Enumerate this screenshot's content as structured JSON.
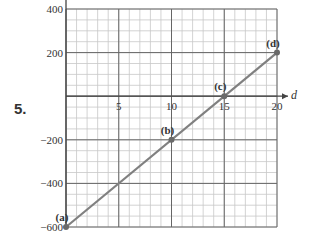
{
  "problem": {
    "number": "5."
  },
  "chart_data": {
    "type": "line",
    "title": "",
    "xlabel": "d",
    "ylabel": "",
    "xlim": [
      0,
      20
    ],
    "ylim": [
      -600,
      400
    ],
    "x_ticks": [
      5,
      10,
      15,
      20
    ],
    "x_tick_labels": [
      "5",
      "10",
      "15",
      "20"
    ],
    "y_ticks": [
      400,
      200,
      -200,
      -400,
      -600
    ],
    "y_tick_labels": [
      "400",
      "200",
      "−200",
      "−400",
      "−600"
    ],
    "grid": {
      "major_x": 5,
      "minor_x": 1,
      "major_y": 200,
      "minor_y": 50
    },
    "series": [
      {
        "name": "line",
        "x": [
          0,
          20
        ],
        "y": [
          -600,
          200
        ],
        "color": "#888888"
      }
    ],
    "points": [
      {
        "label": "(a)",
        "x": 0,
        "y": -600
      },
      {
        "label": "(b)",
        "x": 10,
        "y": -200
      },
      {
        "label": "(c)",
        "x": 15,
        "y": 0
      },
      {
        "label": "(d)",
        "x": 20,
        "y": 200
      }
    ],
    "legend": null
  },
  "colors": {
    "minor_grid": "#c8c8c8",
    "major_grid": "#666666",
    "axis": "#444444",
    "line": "#808080",
    "point": "#6a6a6a"
  }
}
